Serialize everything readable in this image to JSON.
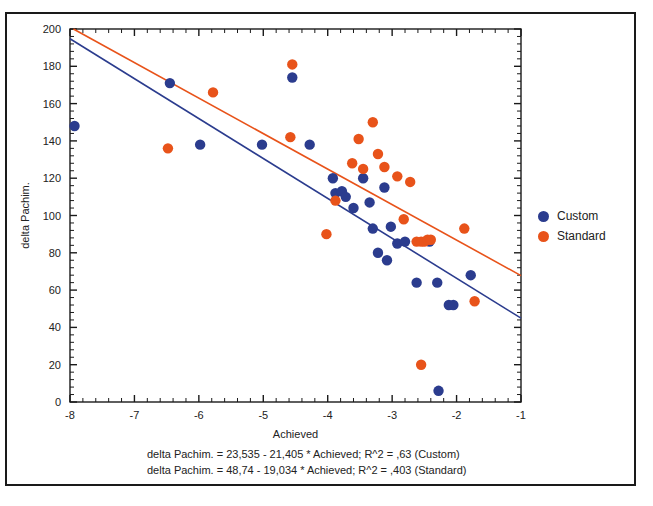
{
  "chart_data": {
    "type": "scatter",
    "title": "",
    "xlabel": "Achieved",
    "ylabel": "delta Pachim.",
    "xlim": [
      -8,
      -1
    ],
    "ylim": [
      0,
      200
    ],
    "xticks": [
      -8,
      -7,
      -6,
      -5,
      -4,
      -3,
      -2,
      -1
    ],
    "yticks": [
      0,
      20,
      40,
      60,
      80,
      100,
      120,
      140,
      160,
      180,
      200
    ],
    "xtick_labels": [
      "-8",
      "-7",
      "-6",
      "-5",
      "-4",
      "-3",
      "-2",
      "-1"
    ],
    "ytick_labels": [
      "0",
      "20",
      "40",
      "60",
      "80",
      "100",
      "120",
      "140",
      "160",
      "180",
      "200"
    ],
    "grid": false,
    "minor_ticks_per_interval": 5,
    "legend_position": "right",
    "series": [
      {
        "name": "Custom",
        "color": "#2B3C8E",
        "marker": "circle",
        "points": [
          [
            -7.93,
            148
          ],
          [
            -6.45,
            171
          ],
          [
            -5.98,
            138
          ],
          [
            -5.02,
            138
          ],
          [
            -4.55,
            174
          ],
          [
            -4.28,
            138
          ],
          [
            -3.92,
            120
          ],
          [
            -3.88,
            112
          ],
          [
            -3.78,
            113
          ],
          [
            -3.72,
            110
          ],
          [
            -3.6,
            104
          ],
          [
            -3.45,
            120
          ],
          [
            -3.35,
            107
          ],
          [
            -3.3,
            93
          ],
          [
            -3.22,
            80
          ],
          [
            -3.12,
            115
          ],
          [
            -3.08,
            76
          ],
          [
            -3.02,
            94
          ],
          [
            -2.92,
            85
          ],
          [
            -2.8,
            86
          ],
          [
            -2.62,
            64
          ],
          [
            -2.42,
            86
          ],
          [
            -2.3,
            64
          ],
          [
            -2.28,
            6
          ],
          [
            -2.12,
            52
          ],
          [
            -2.05,
            52
          ],
          [
            -1.78,
            68
          ]
        ]
      },
      {
        "name": "Standard",
        "color": "#E8531A",
        "marker": "circle",
        "points": [
          [
            -6.48,
            136
          ],
          [
            -5.78,
            166
          ],
          [
            -4.58,
            142
          ],
          [
            -4.55,
            181
          ],
          [
            -4.02,
            90
          ],
          [
            -3.88,
            108
          ],
          [
            -3.62,
            128
          ],
          [
            -3.52,
            141
          ],
          [
            -3.45,
            125
          ],
          [
            -3.3,
            150
          ],
          [
            -3.22,
            133
          ],
          [
            -3.12,
            126
          ],
          [
            -2.92,
            121
          ],
          [
            -2.82,
            98
          ],
          [
            -2.72,
            118
          ],
          [
            -2.62,
            86
          ],
          [
            -2.55,
            86
          ],
          [
            -2.5,
            86
          ],
          [
            -2.45,
            87
          ],
          [
            -2.4,
            87
          ],
          [
            -2.55,
            20
          ],
          [
            -1.88,
            93
          ],
          [
            -1.72,
            54
          ]
        ]
      }
    ],
    "fit_lines": [
      {
        "name": "Custom",
        "color": "#2B3C8E",
        "intercept": 23.535,
        "slope": -21.405,
        "r_squared": 0.63,
        "equation": "delta Pachim. = 23,535 - 21,405 * Achieved; R^2 = ,63 (Custom)"
      },
      {
        "name": "Standard",
        "color": "#E8531A",
        "intercept": 48.74,
        "slope": -19.034,
        "r_squared": 0.403,
        "equation": "delta Pachim. = 48,74 - 19,034 * Achieved; R^2 = ,403 (Standard)"
      }
    ]
  },
  "legend": {
    "items": [
      {
        "label": "Custom",
        "color": "#2B3C8E"
      },
      {
        "label": "Standard",
        "color": "#E8531A"
      }
    ]
  },
  "axis": {
    "x_title": "Achieved",
    "y_title": "delta Pachim."
  },
  "annotations": {
    "line1": "delta Pachim. = 23,535 - 21,405 * Achieved; R^2 = ,63 (Custom)",
    "line2": "delta Pachim. = 48,74 - 19,034 * Achieved; R^2 = ,403 (Standard)"
  }
}
